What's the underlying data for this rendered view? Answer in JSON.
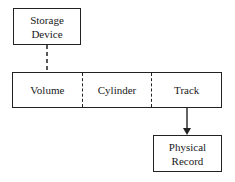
{
  "diagram": {
    "type": "hierarchy",
    "top_node": {
      "line1": "Storage",
      "line2": "Device"
    },
    "segments": [
      {
        "label": "Volume"
      },
      {
        "label": "Cylinder"
      },
      {
        "label": "Track"
      }
    ],
    "bottom_node": {
      "line1": "Physical",
      "line2": "Record"
    },
    "edges": [
      {
        "from": "Storage Device",
        "to": "Volume/Cylinder/Track",
        "style": "dashed",
        "arrow": false
      },
      {
        "from": "Track",
        "to": "Physical Record",
        "style": "solid",
        "arrow": true
      }
    ]
  }
}
